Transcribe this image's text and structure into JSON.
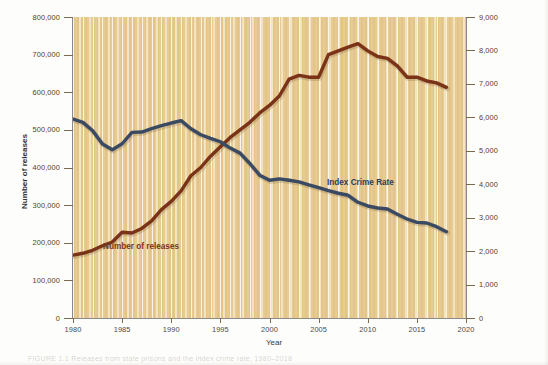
{
  "figure": {
    "caption": "FIGURE 1.1   Releases from state prisons and the index crime rate, 1980–2018"
  },
  "chart_data": {
    "type": "line",
    "title": "",
    "xlabel": "Year",
    "ylabel": "Number of releases",
    "y2label": "Index crimes per 100,000 population",
    "xlim": [
      1980,
      2020
    ],
    "ylim": [
      0,
      800000
    ],
    "y2lim": [
      0,
      9000
    ],
    "xticks": [
      1980,
      1985,
      1990,
      1995,
      2000,
      2005,
      2010,
      2015,
      2020
    ],
    "xticklabels": [
      "1980",
      "1985",
      "1990",
      "1995",
      "2000",
      "2005",
      "2010",
      "2015",
      "2020"
    ],
    "yticks": [
      0,
      100000,
      200000,
      300000,
      400000,
      500000,
      600000,
      700000,
      800000
    ],
    "yticklabels": [
      "0",
      "100,000",
      "200,000",
      "300,000",
      "400,000",
      "500,000",
      "600,000",
      "700,000",
      "800,000"
    ],
    "y2ticks": [
      0,
      1000,
      2000,
      3000,
      4000,
      5000,
      6000,
      7000,
      8000,
      9000
    ],
    "y2ticklabels": [
      "0",
      "1,000",
      "2,000",
      "3,000",
      "4,000",
      "5,000",
      "6,000",
      "7,000",
      "8,000",
      "9,000"
    ],
    "grid": "vertical",
    "legend": "inline-annotations",
    "plot_background": "#e6c98e",
    "x": [
      1980,
      1981,
      1982,
      1983,
      1984,
      1985,
      1986,
      1987,
      1988,
      1989,
      1990,
      1991,
      1992,
      1993,
      1994,
      1995,
      1996,
      1997,
      1998,
      1999,
      2000,
      2001,
      2002,
      2003,
      2004,
      2005,
      2006,
      2007,
      2008,
      2009,
      2010,
      2011,
      2012,
      2013,
      2014,
      2015,
      2016,
      2017,
      2018
    ],
    "series": [
      {
        "name": "Number of releases",
        "axis": "left",
        "color": "#7b3317",
        "units": "releases",
        "values": [
          167000,
          172000,
          180000,
          192000,
          202000,
          228000,
          226000,
          238000,
          258000,
          288000,
          310000,
          338000,
          378000,
          400000,
          430000,
          455000,
          480000,
          500000,
          520000,
          545000,
          565000,
          590000,
          635000,
          645000,
          640000,
          640000,
          700000,
          710000,
          720000,
          729000,
          710000,
          695000,
          690000,
          670000,
          640000,
          640000,
          630000,
          625000,
          613000
        ]
      },
      {
        "name": "Index Crime Rate",
        "axis": "right",
        "color": "#3b4a63",
        "units": "index crimes per 100,000 population",
        "values": [
          5950,
          5850,
          5600,
          5200,
          5030,
          5210,
          5550,
          5560,
          5660,
          5750,
          5830,
          5900,
          5660,
          5480,
          5370,
          5270,
          5080,
          4930,
          4620,
          4270,
          4120,
          4160,
          4120,
          4070,
          3980,
          3900,
          3810,
          3730,
          3670,
          3460,
          3350,
          3290,
          3260,
          3100,
          2960,
          2860,
          2840,
          2730,
          2580
        ]
      }
    ],
    "annotations": [
      {
        "text": "Number of releases",
        "series": "Number of releases",
        "color": "#7b3317",
        "x": 1983.5,
        "y": 195000
      },
      {
        "text": "Index Crime Rate",
        "series": "Index Crime Rate",
        "color": "#2e3c56",
        "x": 2006.5,
        "y_right": 4200
      }
    ]
  }
}
